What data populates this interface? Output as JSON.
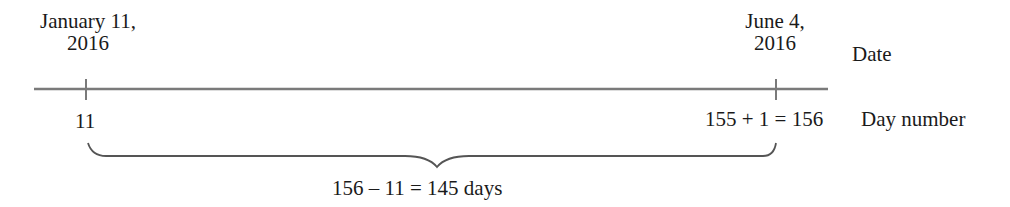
{
  "diagram": {
    "start_date": {
      "line1": "January 11,",
      "line2": "2016"
    },
    "end_date": {
      "line1": "June 4,",
      "line2": "2016"
    },
    "row_labels": {
      "date": "Date",
      "day_number": "Day number"
    },
    "start_day_number": "11",
    "end_day_number": "155 + 1 = 156",
    "difference": "156 – 11 = 145 days",
    "colors": {
      "line": "#777777",
      "text": "#1a1a1a",
      "brace": "#555555"
    }
  }
}
